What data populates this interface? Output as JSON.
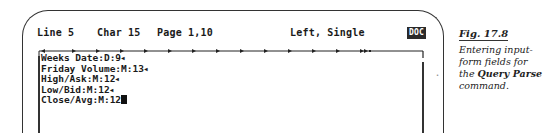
{
  "status_bar": {
    "line": "Line 5",
    "char": "Char 15",
    "page": "Page 1,10",
    "alignment": "Left, Single",
    "mode_badge": "DOC"
  },
  "ruler": {
    "tab_stops": 13
  },
  "document": {
    "lines": [
      {
        "text": "Weeks Date:D:9",
        "end": "◀"
      },
      {
        "text": "Friday Volume:M:13",
        "end": "◀"
      },
      {
        "text": "High/Ask:M:12",
        "end": "◀"
      },
      {
        "text": "Low/Bid:M:12",
        "end": "◀"
      },
      {
        "text": "Close/Avg:M:12",
        "end": "cursor"
      }
    ]
  },
  "caption": {
    "figure": "Fig. 17.8",
    "text_pre": "Entering input-form fields for the ",
    "command": "Query Parse",
    "text_post": " command."
  }
}
